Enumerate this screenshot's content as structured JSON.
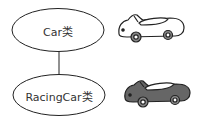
{
  "diagram": {
    "type": "class-inheritance",
    "nodes": [
      {
        "id": "car",
        "label": "Car类",
        "icon": "car-outline-icon"
      },
      {
        "id": "racingcar",
        "label": "RacingCar类",
        "icon": "car-filled-icon"
      }
    ],
    "edges": [
      {
        "from": "car",
        "to": "racingcar"
      }
    ],
    "colors": {
      "stroke": "#222222",
      "car_fill": "#ffffff",
      "racingcar_fill": "#666666",
      "wheel_fill": "#888888"
    }
  }
}
